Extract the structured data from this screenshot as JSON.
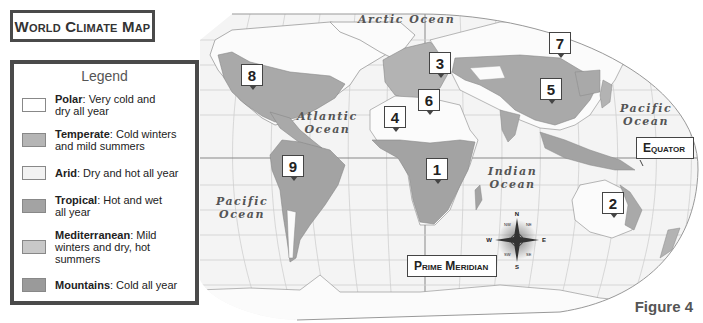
{
  "title": "World Climate Map",
  "legend": {
    "heading": "Legend",
    "items": [
      {
        "name": "Polar",
        "desc": ": Very cold and dry all year",
        "line1": ": Very cold and",
        "line2": "dry all year",
        "color": "#ffffff"
      },
      {
        "name": "Temperate",
        "desc": ": Cold winters and mild summers",
        "line1": ": Cold winters",
        "line2": "and mild summers",
        "color": "#b5b5b5"
      },
      {
        "name": "Arid",
        "desc": ": Dry and hot all year",
        "line1": ": Dry and hot all year",
        "line2": "",
        "color": "#f2f2f2"
      },
      {
        "name": "Tropical",
        "desc": ": Hot and wet all year",
        "line1": ": Hot and wet",
        "line2": "all year",
        "color": "#a3a3a3"
      },
      {
        "name": "Mediterranean",
        "desc": ": Mild winters and dry, hot summers",
        "line1": ": Mild",
        "line2": "winters and dry, hot",
        "line3": "summers",
        "color": "#c8c8c8"
      },
      {
        "name": "Mountains",
        "desc": ": Cold all year",
        "line1": ": Cold all year",
        "line2": "",
        "color": "#9a9a9a"
      }
    ]
  },
  "map": {
    "oceans": [
      {
        "id": "arctic",
        "label": "Arctic Ocean"
      },
      {
        "id": "atlantic",
        "line1": "Atlantic",
        "line2": "Ocean"
      },
      {
        "id": "pacific-east",
        "line1": "Pacific",
        "line2": "Ocean"
      },
      {
        "id": "pacific-west",
        "line1": "Pacific",
        "line2": "Ocean"
      },
      {
        "id": "indian",
        "line1": "Indian",
        "line2": "Ocean"
      }
    ],
    "markers": [
      "1",
      "2",
      "3",
      "4",
      "5",
      "6",
      "7",
      "8",
      "9"
    ],
    "callouts": {
      "equator": "Equator",
      "prime_meridian": "Prime Meridian"
    },
    "compass": {
      "n": "N",
      "s": "S",
      "e": "E",
      "w": "W",
      "ne": "NE",
      "nw": "NW",
      "se": "SE",
      "sw": "SW"
    },
    "colors": {
      "ocean": "#f4f4f4",
      "grid": "#c9c9c9",
      "land_light": "#fafafa",
      "land_dark": "#a6a6a6",
      "land_mid": "#bdbdbd"
    }
  },
  "figure_label": "Figure 4"
}
